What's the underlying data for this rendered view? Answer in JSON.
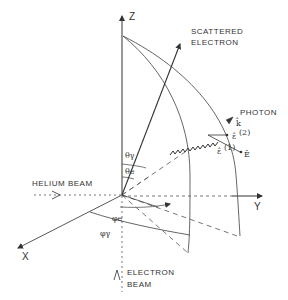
{
  "diagram": {
    "axes": {
      "z_label": "Z",
      "y_label": "Y",
      "x_label": "X"
    },
    "beams": {
      "helium_label": "HELIUM BEAM",
      "electron_label_line1": "ELECTRON",
      "electron_label_line2": "BEAM"
    },
    "scattered": {
      "line1": "SCATTERED",
      "line2": "ELECTRON"
    },
    "photon": {
      "label": "PHOTON",
      "k_vector": "k̂",
      "e2_vector": "ε̂",
      "e2_superscript": "(2)",
      "e1_vector": "ε̂",
      "e1_superscript": "(1)",
      "e_vector": "Ê"
    },
    "angles": {
      "theta_gamma": "θγ",
      "theta_e": "θe",
      "phi_e": "φe",
      "phi_gamma": "φγ"
    },
    "colors": {
      "ink": "#333333",
      "paper": "#ffffff"
    }
  }
}
